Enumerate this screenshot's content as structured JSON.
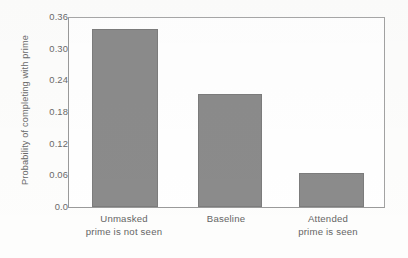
{
  "chart_data": {
    "type": "bar",
    "title": "",
    "xlabel": "",
    "ylabel": "Probability of completing with prime",
    "categories": [
      "Unmasked\nprime is not seen",
      "Baseline",
      "Attended\nprime is seen"
    ],
    "category_lines": [
      [
        "Unmasked",
        "prime is not seen"
      ],
      [
        "Baseline",
        ""
      ],
      [
        "Attended",
        "prime is seen"
      ]
    ],
    "values": [
      0.34,
      0.215,
      0.065
    ],
    "ylim": [
      0.0,
      0.36
    ],
    "yticks": [
      "0.0",
      "0.06",
      "0.12",
      "0.18",
      "0.24",
      "0.30",
      "0.36"
    ],
    "ytick_values": [
      0.0,
      0.06,
      0.12,
      0.18,
      0.24,
      0.3,
      0.36
    ],
    "grid": false,
    "legend": null,
    "bar_color": "#8b8b8b",
    "bar_edge_color": "#7c7c7c",
    "axis_color": "#9a9a9a",
    "text_color": "#656565",
    "background": "#ffffff"
  },
  "axis": {
    "y_title": "Probability of completing with prime",
    "tick_0": "0.0",
    "tick_1": "0.06",
    "tick_2": "0.12",
    "tick_3": "0.18",
    "tick_4": "0.24",
    "tick_5": "0.30",
    "tick_6": "0.36"
  },
  "xlabels": {
    "cat1_line1": "Unmasked",
    "cat1_line2": "prime is not seen",
    "cat2_line1": "Baseline",
    "cat2_line2": "",
    "cat3_line1": "Attended",
    "cat3_line2": "prime is seen"
  }
}
